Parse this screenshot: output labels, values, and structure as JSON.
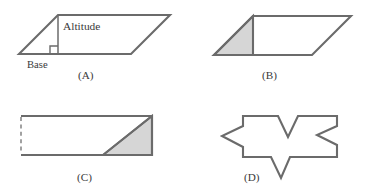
{
  "figure": {
    "stroke_color": "#6b6b6b",
    "shade_color": "#d6d6d6",
    "background_color": "#ffffff",
    "panels": [
      {
        "id": "A",
        "label": "(A)",
        "shape": "parallelogram",
        "annotations": [
          "Altitude",
          "Base"
        ],
        "has_right_angle_mark": true,
        "shaded": false
      },
      {
        "id": "B",
        "label": "(B)",
        "shape": "parallelogram",
        "annotations": [],
        "has_right_angle_mark": false,
        "shaded": true
      },
      {
        "id": "C",
        "label": "(C)",
        "shape": "rectangle",
        "annotations": [],
        "has_right_angle_mark": false,
        "shaded": true
      },
      {
        "id": "D",
        "label": "(D)",
        "shape": "irregular-polygon",
        "annotations": [],
        "has_right_angle_mark": false,
        "shaded": false
      }
    ],
    "labels": {
      "altitude": "Altitude",
      "base": "Base",
      "panel_a": "(A)",
      "panel_b": "(B)",
      "panel_c": "(C)",
      "panel_d": "(D)"
    }
  }
}
